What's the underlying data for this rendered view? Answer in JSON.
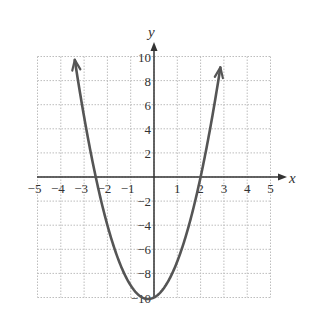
{
  "chart_data": {
    "type": "line",
    "title": "",
    "xlabel": "x",
    "ylabel": "y",
    "xlim": [
      -5,
      5
    ],
    "ylim": [
      -10,
      10
    ],
    "grid": true,
    "grid_style": "dotted",
    "x_ticks": [
      -5,
      -4,
      -3,
      -2,
      -1,
      1,
      2,
      3,
      4,
      5
    ],
    "x_tick_labels": [
      "−5",
      "−4",
      "−3",
      "−2",
      "−1",
      "1",
      "2",
      "3",
      "4",
      "5"
    ],
    "y_ticks": [
      10,
      8,
      6,
      4,
      2,
      -2,
      -4,
      -6,
      -8,
      -10
    ],
    "y_tick_labels": [
      "10",
      "8",
      "6",
      "4",
      "2",
      "−2",
      "−4",
      "−6",
      "−8",
      "−10"
    ],
    "series": [
      {
        "name": "parabola",
        "equation": "y = 2x^2 + x - 10",
        "vertex": [
          0,
          -10
        ],
        "x_intercepts": [
          -2.5,
          2
        ],
        "x": [
          -3.5,
          -3,
          -2.5,
          -2,
          -1.5,
          -1,
          -0.5,
          0,
          0.5,
          1,
          1.5,
          2,
          2.5,
          2.9
        ],
        "y": [
          11,
          5,
          0,
          -4,
          -7,
          -9,
          -10,
          -10,
          -9,
          -7,
          -4,
          0,
          5,
          9.7
        ],
        "arrows": "both ends",
        "color": "#555555"
      }
    ]
  },
  "labels": {
    "x_axis": "x",
    "y_axis": "y"
  },
  "colors": {
    "curve": "#555555",
    "axis": "#333333",
    "grid": "#bdbdbd"
  }
}
